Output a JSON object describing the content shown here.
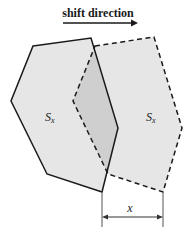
{
  "diagram": {
    "title": "shift direction",
    "colors": {
      "fill": "#e6e6e6",
      "overlap_fill": "#cfcfcf",
      "stroke": "#1a1a1a",
      "dimension": "#444444"
    },
    "shapes": [
      {
        "id": "original",
        "style": "solid",
        "label_main": "S",
        "label_sub": "x",
        "vertices": [
          [
            33,
            46
          ],
          [
            91,
            38
          ],
          [
            118,
            128
          ],
          [
            102,
            192
          ],
          [
            47,
            174
          ],
          [
            11,
            101
          ]
        ]
      },
      {
        "id": "shifted",
        "style": "dashed",
        "label_main": "S",
        "label_sub": "x",
        "vertices": [
          [
            95,
            46
          ],
          [
            154,
            37
          ],
          [
            182,
            128
          ],
          [
            163,
            192
          ],
          [
            108,
            174
          ],
          [
            73,
            101
          ]
        ]
      }
    ],
    "dimension": {
      "label": "x",
      "from_x": 102,
      "to_x": 163,
      "y": 217
    }
  }
}
